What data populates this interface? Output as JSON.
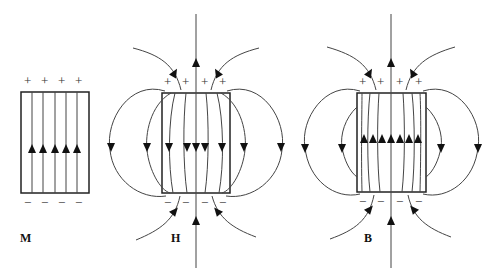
{
  "diagram": {
    "panels": [
      {
        "id": "M",
        "label": "M",
        "top_charge": "+",
        "bottom_charge": "−",
        "field_direction_inside": "up",
        "line_count": 5
      },
      {
        "id": "H",
        "label": "H",
        "top_charge": "+",
        "bottom_charge": "−",
        "field_direction_inside": "down",
        "field_direction_outside": "from + to −"
      },
      {
        "id": "B",
        "label": "B",
        "top_charge": "+",
        "bottom_charge": "−",
        "field_direction_inside": "up",
        "field_direction_outside": "closed loops, top to bottom outside"
      }
    ],
    "plus_sign": "+",
    "minus_sign": "−"
  }
}
